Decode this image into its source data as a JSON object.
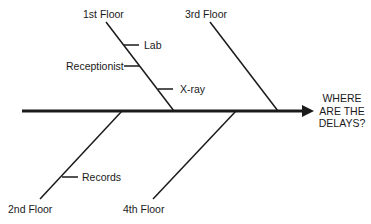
{
  "diagram": {
    "type": "fishbone",
    "effect": {
      "lines": [
        "WHERE",
        "ARE THE",
        "DELAYS?"
      ]
    },
    "categories": [
      {
        "label": "1st Floor",
        "position": "top",
        "causes": [
          "Lab",
          "Receptionist",
          "X-ray"
        ]
      },
      {
        "label": "3rd Floor",
        "position": "top",
        "causes": []
      },
      {
        "label": "2nd Floor",
        "position": "bottom",
        "causes": [
          "Records"
        ]
      },
      {
        "label": "4th Floor",
        "position": "bottom",
        "causes": []
      }
    ],
    "colors": {
      "line": "#1a1a1a",
      "background": "#ffffff"
    }
  }
}
